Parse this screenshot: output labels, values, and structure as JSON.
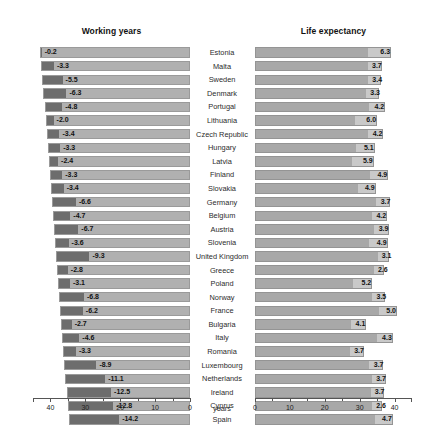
{
  "chart_data": {
    "type": "bar",
    "title": "",
    "subtype": "diverging-back-to-back-bar",
    "xlabel": "years",
    "ylabel": "",
    "grid": false,
    "legend": "none",
    "panels": [
      {
        "name": "working_years",
        "title": "Working years",
        "direction": "left",
        "axis_label": "years",
        "axis_ticks_major": [
          40,
          30,
          20,
          10,
          0
        ],
        "axis_ticks_minor": [
          35,
          25,
          15,
          5
        ],
        "axis_range": [
          0,
          45
        ],
        "axis_reversed": true
      },
      {
        "name": "life_expectancy",
        "title": "Life expectancy",
        "direction": "right",
        "axis_label": "years",
        "axis_ticks_major": [
          0,
          10,
          20,
          30,
          40
        ],
        "axis_ticks_minor": [
          5,
          15,
          25,
          35
        ],
        "axis_range": [
          0,
          45
        ],
        "axis_reversed": false
      }
    ],
    "categories": [
      "Estonia",
      "Malta",
      "Sweden",
      "Denmark",
      "Portugal",
      "Lithuania",
      "Czech Republic",
      "Hungary",
      "Latvia",
      "Finland",
      "Slovakia",
      "Germany",
      "Belgium",
      "Austria",
      "Slovenia",
      "United Kingdom",
      "Greece",
      "Poland",
      "Norway",
      "France",
      "Bulgaria",
      "Italy",
      "Romania",
      "Luxembourg",
      "Netherlands",
      "Ireland",
      "Cyprus",
      "Spain"
    ],
    "series": [
      {
        "name": "Working years",
        "values": [
          -0.2,
          -3.3,
          -5.5,
          -6.3,
          -4.8,
          -2.0,
          -3.4,
          -3.3,
          -2.4,
          -3.3,
          -3.4,
          -6.6,
          -4.7,
          -6.7,
          -3.6,
          -9.3,
          -2.8,
          -3.1,
          -6.8,
          -6.2,
          -2.7,
          -4.6,
          -3.3,
          -8.9,
          -11.1,
          -12.5,
          -12.8,
          -14.2
        ],
        "labels": [
          "-0.2",
          "-3.3",
          "-5.5",
          "-6.3",
          "-4.8",
          "-2.0",
          "-3.4",
          "-3.3",
          "-2.4",
          "-3.3",
          "-3.4",
          "-6.6",
          "-4.7",
          "-6.7",
          "-3.6",
          "-9.3",
          "-2.8",
          "-3.1",
          "-6.8",
          "-6.2",
          "-2.7",
          "-4.6",
          "-3.3",
          "-8.9",
          "-11.1",
          "-12.5",
          "-12.8",
          "-14.2"
        ],
        "bar_totals": [
          43.0,
          42.6,
          42.3,
          42.0,
          41.7,
          41.4,
          41.1,
          40.8,
          40.5,
          40.2,
          39.9,
          39.6,
          39.3,
          39.0,
          38.7,
          38.4,
          38.1,
          37.8,
          37.5,
          37.2,
          36.9,
          36.6,
          36.3,
          36.0,
          35.7,
          35.4,
          35.1,
          34.8
        ]
      },
      {
        "name": "Life expectancy",
        "values": [
          6.3,
          3.7,
          3.4,
          3.3,
          4.2,
          6.0,
          4.2,
          5.1,
          5.9,
          4.9,
          4.9,
          3.7,
          4.2,
          3.9,
          4.9,
          3.1,
          2.6,
          5.2,
          3.5,
          5.0,
          4.1,
          4.3,
          3.7,
          3.7,
          3.7,
          3.7,
          2.6,
          4.7
        ],
        "labels": [
          "6.3",
          "3.7",
          "3.4",
          "3.3",
          "4.2",
          "6.0",
          "4.2",
          "5.1",
          "5.9",
          "4.9",
          "4.9",
          "3.7",
          "4.2",
          "3.9",
          "4.9",
          "3.1",
          "2.6",
          "5.2",
          "3.5",
          "5.0",
          "4.1",
          "4.3",
          "3.7",
          "3.7",
          "3.7",
          "3.7",
          "2.6",
          "4.7"
        ],
        "bar_totals": [
          39.0,
          36.3,
          36.1,
          35.4,
          37.3,
          35.0,
          36.8,
          34.3,
          34.0,
          38.2,
          34.6,
          38.8,
          37.9,
          38.4,
          38.0,
          38.5,
          36.9,
          33.6,
          37.4,
          40.7,
          31.9,
          39.5,
          31.2,
          36.8,
          37.5,
          37.1,
          36.4,
          39.5
        ]
      }
    ],
    "colors": {
      "bar_light": "#b0b0b0",
      "bar_segment_dark": "#6d6d6d",
      "bar_body_right": "#a8a8a8",
      "bar_segment_light": "#c9c9c9",
      "axis": "#555555",
      "text": "#1a1a1a"
    }
  },
  "axis_unit": "years"
}
